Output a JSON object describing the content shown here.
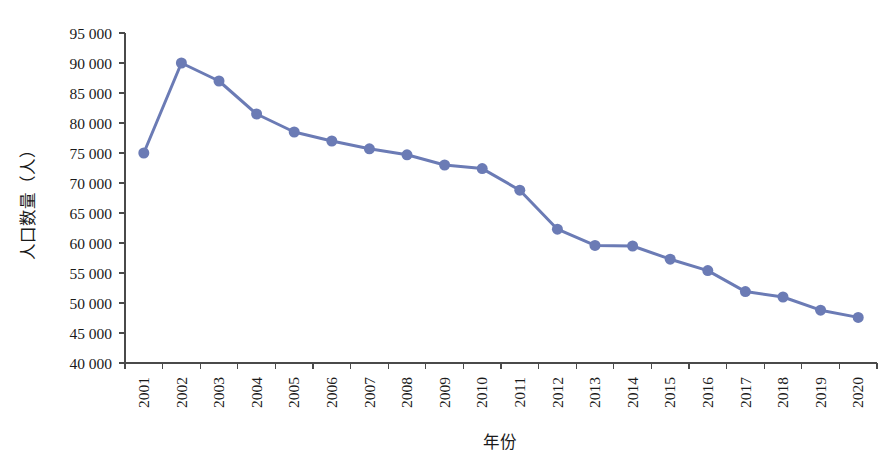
{
  "chart_data": {
    "type": "line",
    "title": "",
    "xlabel": "年份",
    "ylabel": "人口数量（人）",
    "categories": [
      "2001",
      "2002",
      "2003",
      "2004",
      "2005",
      "2006",
      "2007",
      "2008",
      "2009",
      "2010",
      "2011",
      "2012",
      "2013",
      "2014",
      "2015",
      "2016",
      "2017",
      "2018",
      "2019",
      "2020"
    ],
    "values": [
      75000,
      90000,
      87000,
      81500,
      78500,
      77000,
      75700,
      74700,
      73000,
      72400,
      68800,
      62300,
      59600,
      59500,
      57300,
      55400,
      51900,
      51000,
      48800,
      47600
    ],
    "series": [
      {
        "name": "人口数量",
        "values": [
          75000,
          90000,
          87000,
          81500,
          78500,
          77000,
          75700,
          74700,
          73000,
          72400,
          68800,
          62300,
          59600,
          59500,
          57300,
          55400,
          51900,
          51000,
          48800,
          47600
        ]
      }
    ],
    "ylim": [
      40000,
      95000
    ],
    "ytick_step": 5000,
    "ytick_labels": [
      "95 000",
      "90 000",
      "85 000",
      "80 000",
      "75 000",
      "70 000",
      "65 000",
      "60 000",
      "55 000",
      "50 000",
      "45 000",
      "40 000"
    ],
    "ytick_values": [
      95000,
      90000,
      85000,
      80000,
      75000,
      70000,
      65000,
      60000,
      55000,
      50000,
      45000,
      40000
    ],
    "xtick_rotation": -90,
    "grid": false,
    "legend": false,
    "legend_position": "none",
    "colors": {
      "series_line": "#6B7BB5",
      "series_marker": "#6B7BB5",
      "axis": "#4a4a4a",
      "text": "#1a1a1a",
      "background": "#ffffff"
    },
    "line_width": 3,
    "marker_radius": 5.5,
    "marker_shape": "circle"
  }
}
